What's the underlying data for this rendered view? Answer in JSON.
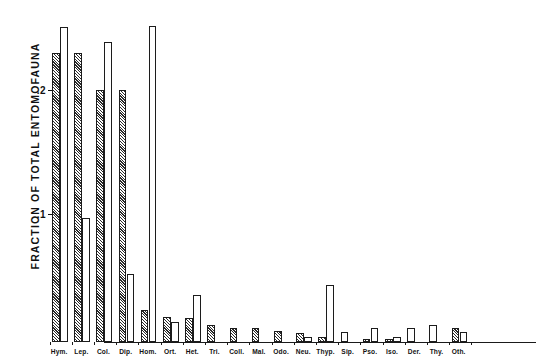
{
  "chart_data": {
    "type": "bar",
    "title": "",
    "xlabel": "",
    "ylabel": "FRACTION OF TOTAL ENTOMOFAUNA",
    "ylim": [
      0,
      0.26
    ],
    "yticks": [
      0.1,
      0.2
    ],
    "ytick_labels": [
      ".1",
      ".2"
    ],
    "grid": false,
    "legend_position": "none",
    "categories": [
      "Hym.",
      "Lep.",
      "Col.",
      "Dip.",
      "Hom.",
      "Ort.",
      "Het.",
      "Tri.",
      "Coll.",
      "Mal.",
      "Odo.",
      "Neu.",
      "Thyp.",
      "Sip.",
      "Pso.",
      "Iso.",
      "Der.",
      "Thy.",
      "Oth."
    ],
    "series": [
      {
        "name": "hatched",
        "fill": "hatched",
        "values": [
          0.233,
          0.233,
          0.203,
          0.203,
          0.026,
          0.02,
          0.019,
          0.014,
          0.0115,
          0.0115,
          0.009,
          0.0075,
          0.004,
          0.0,
          0.0028,
          0.0028,
          0.0,
          0.0,
          0.0115
        ]
      },
      {
        "name": "open",
        "fill": "open",
        "values": [
          0.254,
          0.1,
          0.242,
          0.055,
          0.255,
          0.016,
          0.038,
          0.0,
          0.0,
          0.0,
          0.0,
          0.004,
          0.046,
          0.008,
          0.0115,
          0.004,
          0.0115,
          0.014,
          0.008
        ]
      }
    ]
  },
  "axis": {
    "y_title": "FRACTION OF TOTAL ENTOMOFAUNA",
    "tick_high": ".2",
    "tick_low": ".1"
  }
}
